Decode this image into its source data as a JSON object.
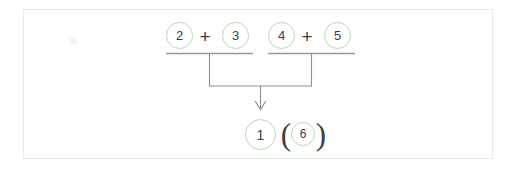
{
  "figure": {
    "card": {
      "border_color": "#e2efe0",
      "background": "#fefffe"
    },
    "colors": {
      "circle_stroke": "#b9d9b0",
      "digit": "#3c4043",
      "rule_line": "#9a9a9a",
      "connector_line": "#8f8f8f",
      "card_border": "#e2efe0",
      "page_background": "#ffffff"
    },
    "groups": [
      {
        "name": "left-addition-group",
        "operands": [
          {
            "value": "2",
            "circled": true
          },
          {
            "value": "3",
            "circled": true
          }
        ],
        "operator": "+",
        "has_underline": true
      },
      {
        "name": "right-addition-group",
        "operands": [
          {
            "value": "4",
            "circled": true
          },
          {
            "value": "5",
            "circled": true
          }
        ],
        "operator": "+",
        "has_underline": true
      }
    ],
    "connector": {
      "name": "merge-arrow",
      "direction": "down",
      "arrowhead": "v"
    },
    "result": {
      "name": "result-row",
      "main": {
        "value": "1",
        "circled": true
      },
      "open_paren": "(",
      "secondary": {
        "value": "6",
        "circled": true
      },
      "close_paren": ")"
    }
  }
}
